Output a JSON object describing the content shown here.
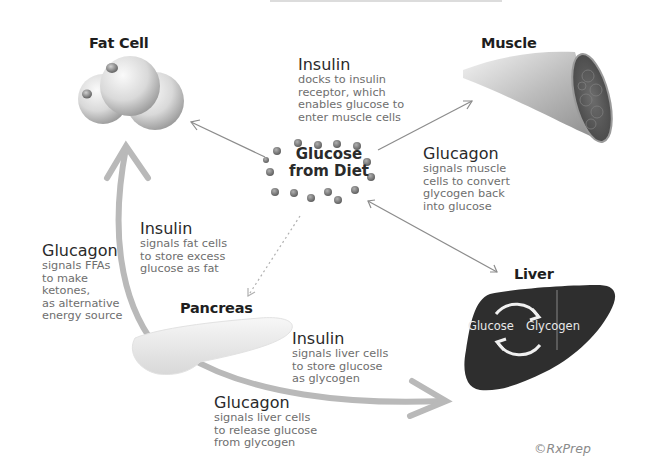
{
  "diagram": {
    "nodes": {
      "fat_cell": "Fat Cell",
      "muscle": "Muscle",
      "glucose": "Glucose\nfrom Diet",
      "pancreas": "Pancreas",
      "liver": "Liver"
    },
    "liver_cycle": {
      "left": "Glucose",
      "right": "Glycogen"
    },
    "annotations": {
      "insulin_muscle": {
        "hormone": "Insulin",
        "text": "docks to insulin\nreceptor, which\nenables glucose to\nenter muscle cells"
      },
      "glucagon_muscle": {
        "hormone": "Glucagon",
        "text": "signals muscle\ncells to convert\nglycogen back\ninto glucose"
      },
      "insulin_fat": {
        "hormone": "Insulin",
        "text": "signals fat cells\nto store excess\nglucose as fat"
      },
      "glucagon_fat": {
        "hormone": "Glucagon",
        "text": "signals FFAs\nto make\nketones,\nas alternative\nenergy source"
      },
      "insulin_liver": {
        "hormone": "Insulin",
        "text": "signals liver cells\nto store glucose\nas glycogen"
      },
      "glucagon_liver": {
        "hormone": "Glucagon",
        "text": "signals liver cells\nto release glucose\nfrom glycogen"
      }
    },
    "edges": [
      {
        "from": "glucose",
        "to": "fat_cell",
        "style": "thin arrow"
      },
      {
        "from": "glucose",
        "to": "muscle",
        "style": "thin arrow"
      },
      {
        "from": "glucose",
        "to": "liver",
        "style": "thin double arrow"
      },
      {
        "from": "glucose",
        "to": "pancreas",
        "style": "dotted arrow"
      },
      {
        "from": "pancreas",
        "to": "fat_cell",
        "style": "thick curved arrow"
      },
      {
        "from": "pancreas",
        "to": "liver",
        "style": "thick curved arrow"
      }
    ],
    "copyright": "©RxPrep",
    "colors": {
      "arrow_thick": "#b9b9b9",
      "arrow_thin": "#8c8c8c",
      "liver_fill": "#2e2e2e",
      "dot": "#7a7a7a",
      "text_body": "#6e6e6e"
    }
  }
}
